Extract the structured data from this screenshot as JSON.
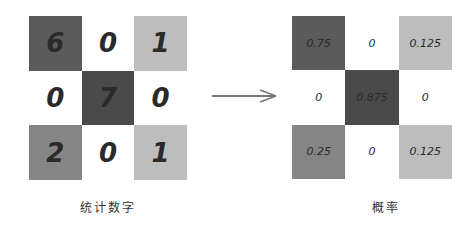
{
  "left_grid": {
    "title": "统计数字",
    "cells": [
      {
        "value": "6",
        "color": "#5b5b5b"
      },
      {
        "value": "0",
        "color": "#ffffff"
      },
      {
        "value": "1",
        "color": "#bdbdbd"
      },
      {
        "value": "0",
        "color": "#ffffff"
      },
      {
        "value": "7",
        "color": "#4a4a4a"
      },
      {
        "value": "0",
        "color": "#ffffff"
      },
      {
        "value": "2",
        "color": "#858585"
      },
      {
        "value": "0",
        "color": "#ffffff"
      },
      {
        "value": "1",
        "color": "#bdbdbd"
      }
    ]
  },
  "right_grid": {
    "title": "概率",
    "cells": [
      {
        "value": "0.75",
        "color": "#5b5b5b"
      },
      {
        "value": "0",
        "color": "#ffffff"
      },
      {
        "value": "0.125",
        "color": "#bdbdbd"
      },
      {
        "value": "0",
        "color": "#ffffff"
      },
      {
        "value": "0.875",
        "color": "#4a4a4a"
      },
      {
        "value": "0",
        "color": "#ffffff"
      },
      {
        "value": "0.25",
        "color": "#858585"
      },
      {
        "value": "0",
        "color": "#ffffff"
      },
      {
        "value": "0.125",
        "color": "#bdbdbd"
      }
    ]
  },
  "arrow": {
    "icon": "right-arrow-icon",
    "color": "#777777"
  }
}
